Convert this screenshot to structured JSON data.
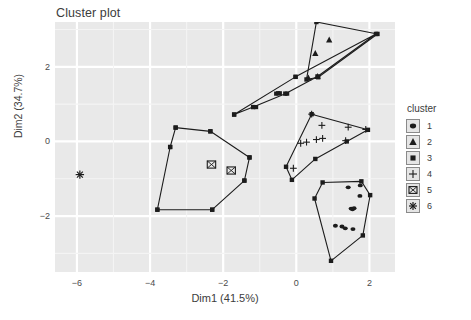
{
  "chart_data": {
    "type": "scatter",
    "title": "Cluster plot",
    "xlabel": "Dim1 (41.5%)",
    "ylabel": "Dim2 (34.7%)",
    "xlim": [
      -6.6,
      2.7
    ],
    "ylim": [
      -3.5,
      3.2
    ],
    "xticks": [
      -6,
      -4,
      -2,
      0,
      2
    ],
    "yticks": [
      2,
      0,
      -2
    ],
    "grid": true,
    "panel_background": "#e9e9e9",
    "grid_color": "#ffffff",
    "legend": {
      "title": "cluster",
      "position": "right",
      "entries": [
        {
          "label": "1",
          "marker": "filled-circle"
        },
        {
          "label": "2",
          "marker": "filled-triangle"
        },
        {
          "label": "3",
          "marker": "filled-square"
        },
        {
          "label": "4",
          "marker": "plus"
        },
        {
          "label": "5",
          "marker": "square-cross"
        },
        {
          "label": "6",
          "marker": "asterisk"
        }
      ]
    },
    "series": [
      {
        "name": "1",
        "marker": "filled-circle",
        "points": [
          [
            1.42,
            -1.23
          ],
          [
            1.75,
            -1.18
          ],
          [
            1.74,
            -1.46
          ],
          [
            1.5,
            -1.8
          ],
          [
            1.54,
            -1.82
          ],
          [
            1.58,
            -1.79
          ],
          [
            1.34,
            -2.33
          ],
          [
            1.55,
            -2.35
          ],
          [
            1.07,
            -2.26
          ],
          [
            1.25,
            -2.28
          ]
        ],
        "hull": [
          [
            0.72,
            -1.1
          ],
          [
            1.78,
            -1.07
          ],
          [
            2.02,
            -1.44
          ],
          [
            1.82,
            -2.52
          ],
          [
            0.95,
            -3.2
          ],
          [
            0.5,
            -1.53
          ]
        ]
      },
      {
        "name": "2",
        "marker": "filled-triangle",
        "points": [
          [
            0.52,
            2.36
          ],
          [
            0.9,
            2.72
          ],
          [
            0.58,
            1.74
          ],
          [
            0.33,
            1.7
          ]
        ],
        "hull": [
          [
            0.55,
            3.2
          ],
          [
            2.22,
            2.88
          ],
          [
            0.6,
            1.72
          ],
          [
            0.28,
            1.66
          ]
        ]
      },
      {
        "name": "3",
        "marker": "filled-square",
        "points": [
          [
            -0.55,
            1.28
          ],
          [
            -0.5,
            1.29
          ],
          [
            -0.45,
            1.29
          ],
          [
            -0.25,
            1.28
          ],
          [
            -1.1,
            0.92
          ],
          [
            -3.3,
            0.37
          ],
          [
            -2.35,
            0.27
          ],
          [
            -3.45,
            -0.15
          ],
          [
            -1.28,
            -0.43
          ],
          [
            -3.8,
            -1.83
          ],
          [
            -2.3,
            -1.83
          ],
          [
            -1.42,
            -1.05
          ],
          [
            -1.7,
            0.72
          ],
          [
            -0.02,
            1.73
          ]
        ],
        "hull": [
          [
            -3.3,
            0.37
          ],
          [
            -2.35,
            0.27
          ],
          [
            -1.28,
            -0.43
          ],
          [
            -1.42,
            -1.05
          ],
          [
            -2.3,
            -1.83
          ],
          [
            -3.8,
            -1.83
          ],
          [
            -3.45,
            -0.15
          ]
        ],
        "hull2": [
          [
            -1.7,
            0.72
          ],
          [
            -0.02,
            1.73
          ],
          [
            2.18,
            2.88
          ],
          [
            0.58,
            1.74
          ],
          [
            -0.3,
            1.28
          ],
          [
            -1.18,
            0.92
          ]
        ]
      },
      {
        "name": "4",
        "marker": "plus",
        "points": [
          [
            0.42,
            0.73
          ],
          [
            0.7,
            0.43
          ],
          [
            0.72,
            0.08
          ],
          [
            0.55,
            0.05
          ],
          [
            0.28,
            -0.02
          ],
          [
            0.12,
            -0.05
          ],
          [
            1.42,
            0.38
          ],
          [
            1.35,
            0.02
          ],
          [
            1.9,
            0.32
          ],
          [
            -0.08,
            -0.72
          ]
        ],
        "hull": [
          [
            0.42,
            0.73
          ],
          [
            1.96,
            0.31
          ],
          [
            1.38,
            0.0
          ],
          [
            0.52,
            -0.47
          ],
          [
            -0.12,
            -1.03
          ],
          [
            -0.28,
            -0.68
          ]
        ]
      },
      {
        "name": "5",
        "marker": "square-cross",
        "points": [
          [
            -2.32,
            -0.62
          ],
          [
            -1.78,
            -0.78
          ]
        ],
        "hull": []
      },
      {
        "name": "6",
        "marker": "asterisk",
        "points": [
          [
            -5.92,
            -0.89
          ]
        ],
        "hull": []
      }
    ]
  }
}
